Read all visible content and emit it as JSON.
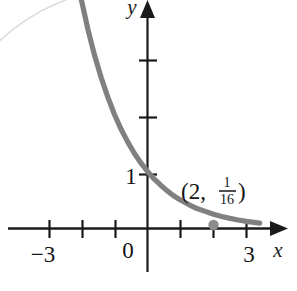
{
  "figure": {
    "name": "exponential-decay-graph",
    "background_color": "#ffffff"
  },
  "chart_data": {
    "type": "line",
    "title": "",
    "subtitle": "",
    "xlabel": "x",
    "ylabel": "y",
    "function": "y = (1/4)^x",
    "curve_color": "#808080",
    "axis_color": "#1a1a1a",
    "grid": false,
    "legend": null,
    "xlim": [
      -4.15,
      3.75
    ],
    "ylim": [
      -0.45,
      4.0
    ],
    "x_ticks": [
      -3,
      -2,
      -1,
      0,
      1,
      2,
      3
    ],
    "x_tick_labels": [
      "−3",
      "",
      "",
      "0",
      "",
      "",
      "3"
    ],
    "y_ticks": [
      1,
      2,
      3
    ],
    "y_tick_labels": [
      "1",
      "",
      ""
    ],
    "x": [
      -2.15,
      -2.0,
      -1.8,
      -1.6,
      -1.4,
      -1.2,
      -1.0,
      -0.8,
      -0.6,
      -0.4,
      -0.2,
      0.0,
      0.2,
      0.4,
      0.6,
      0.8,
      1.0,
      1.25,
      1.5,
      1.75,
      2.0,
      2.25,
      2.5,
      2.75,
      3.0,
      3.4
    ],
    "y": [
      4.2,
      4.0,
      3.48,
      3.03,
      2.64,
      2.3,
      2.0,
      1.74,
      1.52,
      1.32,
      1.15,
      1.0,
      0.87,
      0.76,
      0.66,
      0.57,
      0.5,
      0.42,
      0.35,
      0.3,
      0.25,
      0.21,
      0.177,
      0.149,
      0.125,
      0.094
    ],
    "annotations": [
      {
        "name": "marked-point",
        "x": 2,
        "y": 0.0625,
        "label_text": "(2,",
        "label_fraction_numerator": "1",
        "label_fraction_denominator": "16",
        "label_close": ")",
        "marker_color": "#8c8c8c"
      }
    ]
  },
  "axes": {
    "x_axis_name": "x-axis",
    "y_axis_name": "y-axis",
    "x_arrow": "right-arrowhead",
    "y_arrow": "up-arrowhead"
  },
  "artifacts": {
    "corner_arc": {
      "name": "scan-artifact-arc",
      "color": "#dcdcdc"
    }
  }
}
